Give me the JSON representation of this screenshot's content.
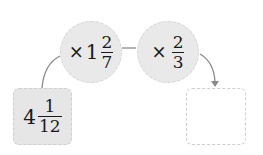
{
  "diagram": {
    "start": {
      "whole": "4",
      "numerator": "1",
      "denominator": "12"
    },
    "steps": [
      {
        "operator": "×",
        "whole": "1",
        "numerator": "2",
        "denominator": "7"
      },
      {
        "operator": "×",
        "whole": "",
        "numerator": "2",
        "denominator": "3"
      }
    ],
    "result": {
      "value": ""
    },
    "colors": {
      "step_fill": "#e9e9e9",
      "start_fill": "#e6e6e6",
      "result_fill": "#ffffff",
      "connector": "#8a8a8a"
    }
  }
}
